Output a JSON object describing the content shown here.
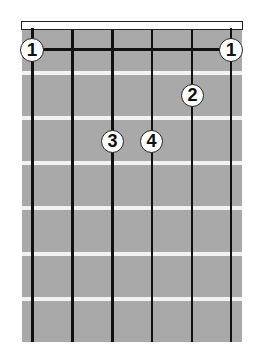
{
  "diagram": {
    "type": "guitar-chord-diagram",
    "strings": 6,
    "frets_shown": 7,
    "colors": {
      "fretboard": "#a9a9a9",
      "fret_line": "#f2f2f2",
      "string": "#111111",
      "nut": "#ffffff",
      "finger_fill": "#ffffff",
      "finger_text": "#111111"
    },
    "barre": {
      "fret": 1,
      "from_string": 6,
      "to_string": 1,
      "finger": "1"
    },
    "fingers": [
      {
        "label": "1",
        "string": 6,
        "fret": 1
      },
      {
        "label": "1",
        "string": 1,
        "fret": 1
      },
      {
        "label": "2",
        "string": 2,
        "fret": 2
      },
      {
        "label": "3",
        "string": 4,
        "fret": 3
      },
      {
        "label": "4",
        "string": 3,
        "fret": 3
      }
    ]
  }
}
